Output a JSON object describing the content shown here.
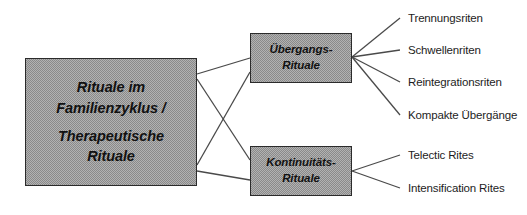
{
  "diagram": {
    "type": "tree",
    "background": "#ffffff",
    "node_fill": "#b2b2b2",
    "node_border": "#2b2b2b",
    "edge_color": "#4a4a4a",
    "root": {
      "id": "node-root",
      "lines": [
        "Rituale  im",
        "Familienzyklus /",
        "Therapeutische",
        "Rituale"
      ]
    },
    "branches": [
      {
        "id": "node-uebergang",
        "lines": [
          "Übergangs-",
          "Rituale"
        ],
        "leaves": [
          "Trennungsriten",
          "Schwellenriten",
          "Reintegrationsriten",
          "Kompakte Übergänge"
        ]
      },
      {
        "id": "node-kontinuitaet",
        "lines": [
          "Kontinuitäts-",
          "Rituale"
        ],
        "leaves": [
          "Telectic Rites",
          "Intensification Rites"
        ]
      }
    ],
    "leaf_labels": [
      "Trennungsriten",
      "Schwellenriten",
      "Reintegrationsriten",
      "Kompakte Übergänge",
      "Telectic Rites",
      "Intensification Rites"
    ]
  }
}
